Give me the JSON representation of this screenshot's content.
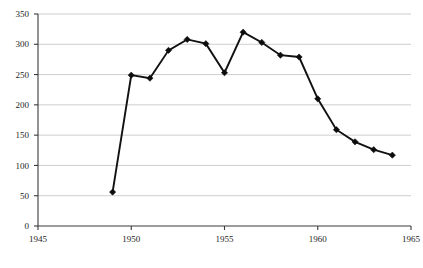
{
  "chart_data": {
    "type": "line",
    "title": "",
    "subtitle": "",
    "xlabel": "",
    "ylabel": "",
    "xlim": [
      1945,
      1965
    ],
    "ylim": [
      0,
      350
    ],
    "xticks": [
      1945,
      1950,
      1955,
      1960,
      1965
    ],
    "xtick_labels": [
      "1945",
      "1950",
      "1955",
      "1960",
      "1965"
    ],
    "yticks": [
      0,
      50,
      100,
      150,
      200,
      250,
      300,
      350
    ],
    "ytick_labels": [
      "0",
      "50",
      "100",
      "150",
      "200",
      "250",
      "300",
      "350"
    ],
    "grid": "horizontal",
    "legend": "none",
    "marker": "diamond",
    "line_color": "#111111",
    "marker_color": "#0d0d0d",
    "grid_color": "#b9b9b9",
    "axis_color": "#3a3a3a",
    "x": [
      1949,
      1950,
      1951,
      1952,
      1953,
      1954,
      1955,
      1956,
      1957,
      1958,
      1959,
      1960,
      1961,
      1962,
      1963,
      1964
    ],
    "values": [
      56,
      249,
      244,
      290,
      308,
      301,
      253,
      320,
      303,
      282,
      279,
      210,
      159,
      139,
      126,
      117
    ],
    "series": [
      {
        "name": "",
        "points": [
          {
            "x": 1949,
            "y": 56
          },
          {
            "x": 1950,
            "y": 249
          },
          {
            "x": 1951,
            "y": 244
          },
          {
            "x": 1952,
            "y": 290
          },
          {
            "x": 1953,
            "y": 308
          },
          {
            "x": 1954,
            "y": 301
          },
          {
            "x": 1955,
            "y": 253
          },
          {
            "x": 1956,
            "y": 320
          },
          {
            "x": 1957,
            "y": 303
          },
          {
            "x": 1958,
            "y": 282
          },
          {
            "x": 1959,
            "y": 279
          },
          {
            "x": 1960,
            "y": 210
          },
          {
            "x": 1961,
            "y": 159
          },
          {
            "x": 1962,
            "y": 139
          },
          {
            "x": 1963,
            "y": 126
          },
          {
            "x": 1964,
            "y": 117
          }
        ]
      }
    ],
    "annotations": []
  },
  "plot_geometry": {
    "left": 38,
    "right": 411,
    "top": 14,
    "bottom": 226
  }
}
